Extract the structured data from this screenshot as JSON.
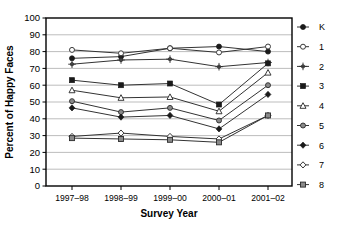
{
  "chart_data": {
    "type": "line",
    "title": "",
    "xlabel": "Survey Year",
    "ylabel": "Percent of Happy Faces",
    "categories": [
      "1997–98",
      "1998–99",
      "1999–00",
      "2000–01",
      "2001–02"
    ],
    "ylim": [
      0,
      100
    ],
    "yticks": [
      0,
      10,
      20,
      30,
      40,
      50,
      60,
      70,
      80,
      90,
      100
    ],
    "ytick_labels": [
      "0",
      "10",
      "20",
      "30",
      "40",
      "50",
      "60",
      "70",
      "80",
      "90",
      "100"
    ],
    "grid": true,
    "grid_axis": "y",
    "legend_position": "right",
    "series": [
      {
        "name": "K",
        "marker": "filled-circle",
        "color": "#1a1a1a",
        "values": [
          76,
          77,
          82,
          83,
          80
        ]
      },
      {
        "name": "1",
        "marker": "open-circle",
        "color": "#777777",
        "values": [
          81,
          79,
          82,
          79.5,
          83
        ]
      },
      {
        "name": "2",
        "marker": "star",
        "color": "#555555",
        "values": [
          72.5,
          75,
          75.5,
          71,
          73.5
        ]
      },
      {
        "name": "3",
        "marker": "filled-square",
        "color": "#1a1a1a",
        "values": [
          63,
          60,
          61,
          48.5,
          73
        ]
      },
      {
        "name": "4",
        "marker": "open-triangle",
        "color": "#888888",
        "values": [
          57,
          52.5,
          53,
          44.5,
          67.5
        ]
      },
      {
        "name": "5",
        "marker": "gray-circle",
        "color": "#666666",
        "values": [
          50.5,
          44,
          46.5,
          39,
          60
        ]
      },
      {
        "name": "6",
        "marker": "filled-diamond",
        "color": "#1a1a1a",
        "values": [
          46.5,
          41,
          42,
          34,
          54.5
        ]
      },
      {
        "name": "7",
        "marker": "open-diamond",
        "color": "#888888",
        "values": [
          29.5,
          31.5,
          29.5,
          28,
          42
        ]
      },
      {
        "name": "8",
        "marker": "gray-square",
        "color": "#666666",
        "values": [
          28.5,
          28,
          27.5,
          26,
          42
        ]
      }
    ]
  },
  "legend": {
    "items": [
      {
        "label": "K"
      },
      {
        "label": "1"
      },
      {
        "label": "2"
      },
      {
        "label": "3"
      },
      {
        "label": "4"
      },
      {
        "label": "5"
      },
      {
        "label": "6"
      },
      {
        "label": "7"
      },
      {
        "label": "8"
      }
    ]
  },
  "colors": {
    "axis": "#000000",
    "grid": "#b5b5b5",
    "plot_background": "#ffffff",
    "line": "#333333"
  }
}
